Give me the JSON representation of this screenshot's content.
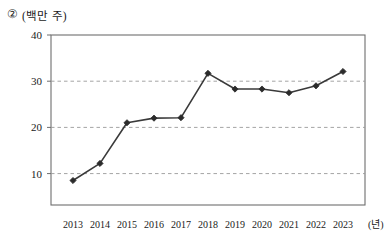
{
  "figure": {
    "marker_number": "②",
    "unit_label": "(백만 주)",
    "x_unit_label": "(년)"
  },
  "chart_data": {
    "type": "line",
    "title": "",
    "subtitle": "",
    "xlabel": "(년)",
    "ylabel": "(백만 주)",
    "categories": [
      "2013",
      "2014",
      "2015",
      "2016",
      "2017",
      "2018",
      "2019",
      "2020",
      "2021",
      "2022",
      "2023"
    ],
    "series": [
      {
        "name": "②",
        "values": [
          8.5,
          12.2,
          21.0,
          22.0,
          22.1,
          31.7,
          28.3,
          28.3,
          27.5,
          29.0,
          32.1
        ]
      }
    ],
    "ylim": [
      3.2,
      40
    ],
    "yticks": [
      10,
      20,
      30,
      40
    ],
    "ytick_labels": [
      "10",
      "20",
      "30",
      "40"
    ],
    "xtick_labels": [
      "2013",
      "2014",
      "2015",
      "2016",
      "2017",
      "2018",
      "2019",
      "2020",
      "2021",
      "2022",
      "2023"
    ],
    "grid": "horizontal-dashed",
    "legend": "none",
    "marker": "diamond",
    "line_color": "#3a3a3a",
    "marker_color": "#2b2b2b",
    "grid_color": "#9a9a9a",
    "frame_color": "#6e6e6e"
  }
}
